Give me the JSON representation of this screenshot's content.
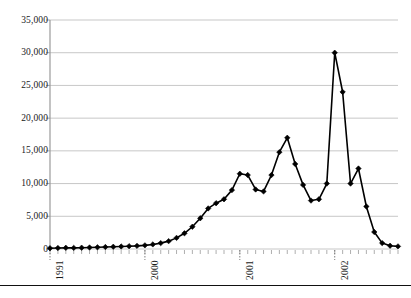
{
  "chart_data": {
    "type": "line",
    "title": "",
    "subtitle": "",
    "xlabel": "",
    "ylabel": "",
    "ylim": [
      0,
      35000
    ],
    "ytick_labels": [
      "0",
      "5,000",
      "10,000",
      "15,000",
      "20,000",
      "25,000",
      "30,000",
      "35,000"
    ],
    "ytick_values": [
      0,
      5000,
      10000,
      15000,
      20000,
      25000,
      30000,
      35000
    ],
    "xtick_labels": [
      "1991",
      "2000",
      "2001",
      "2002"
    ],
    "xtick_values": [
      0,
      12,
      24,
      36
    ],
    "grid": true,
    "legend": false,
    "legend_position": "none",
    "marker": "diamond",
    "line_color": "#000000",
    "marker_color": "#000000",
    "grid_color": "#b9b9b9",
    "axis_color": "#9a9a9a",
    "frequency": "monthly",
    "x": [
      0,
      1,
      2,
      3,
      4,
      5,
      6,
      7,
      8,
      9,
      10,
      11,
      12,
      13,
      14,
      15,
      16,
      17,
      18,
      19,
      20,
      21,
      22,
      23,
      24,
      25,
      26,
      27,
      28,
      29,
      30,
      31,
      32,
      33,
      34,
      35,
      36,
      37,
      38,
      39,
      40,
      41,
      42,
      43,
      44
    ],
    "values": [
      120,
      150,
      180,
      170,
      200,
      230,
      260,
      300,
      340,
      380,
      430,
      480,
      560,
      700,
      900,
      1200,
      1700,
      2400,
      3400,
      4700,
      6200,
      7000,
      7600,
      9000,
      11500,
      11300,
      9100,
      8800,
      11300,
      14800,
      17000,
      13000,
      9800,
      7400,
      7600,
      10000,
      30000,
      24000,
      10000,
      12300,
      6500,
      2600,
      900,
      500,
      400
    ],
    "annotations": []
  },
  "figure": {
    "page_rule_present": true
  }
}
